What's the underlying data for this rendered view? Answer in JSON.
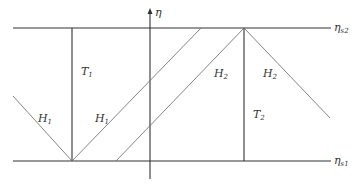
{
  "diagram": {
    "axis_label": "η",
    "top_boundary_label": "η",
    "top_boundary_sub": "s2",
    "bottom_boundary_label": "η",
    "bottom_boundary_sub": "s1",
    "regions": [
      {
        "id": "H1-left",
        "label": "H",
        "sub": "1"
      },
      {
        "id": "T1",
        "label": "T",
        "sub": "1"
      },
      {
        "id": "H1-mid",
        "label": "H",
        "sub": "1"
      },
      {
        "id": "H2-mid",
        "label": "H",
        "sub": "2"
      },
      {
        "id": "T2",
        "label": "T",
        "sub": "2"
      },
      {
        "id": "H2-right",
        "label": "H",
        "sub": "2"
      }
    ],
    "colors": {
      "line": "#333333",
      "thin_line": "#555555",
      "background": "#ffffff"
    }
  }
}
